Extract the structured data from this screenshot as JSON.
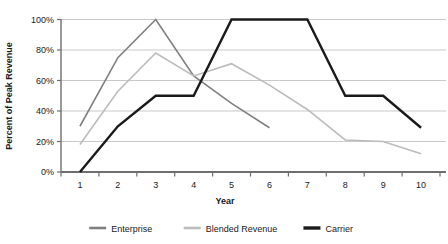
{
  "chart_data": {
    "type": "line",
    "title": "",
    "xlabel": "Year",
    "ylabel": "Percent of Peak Revenue",
    "categories": [
      "1",
      "2",
      "3",
      "4",
      "5",
      "6",
      "7",
      "8",
      "9",
      "10"
    ],
    "x": [
      1,
      2,
      3,
      4,
      5,
      6,
      7,
      8,
      9,
      10
    ],
    "ylim": [
      0,
      100
    ],
    "ytick_labels": [
      "0%",
      "20%",
      "40%",
      "60%",
      "80%",
      "100%"
    ],
    "ytick_values": [
      0,
      20,
      40,
      60,
      80,
      100
    ],
    "grid": true,
    "legend_position": "bottom",
    "series": [
      {
        "name": "Enterprise",
        "color": "#808080",
        "width": 1.6,
        "values": [
          30,
          75,
          100,
          63,
          45,
          29,
          null,
          null,
          null,
          null
        ]
      },
      {
        "name": "Blended Revenue",
        "color": "#bcbcbc",
        "width": 1.6,
        "values": [
          18,
          53,
          78,
          63,
          71,
          57,
          41,
          21,
          20,
          12
        ]
      },
      {
        "name": "Carrier",
        "color": "#1a1a1a",
        "width": 2.4,
        "values": [
          0,
          30,
          50,
          50,
          100,
          100,
          100,
          50,
          50,
          29
        ]
      }
    ]
  },
  "axes": {
    "x_label": "Year",
    "y_label": "Percent of Peak Revenue"
  },
  "legend": {
    "items": [
      {
        "label": "Enterprise",
        "color": "#808080",
        "width": 2.6
      },
      {
        "label": "Blended Revenue",
        "color": "#bcbcbc",
        "width": 2.6
      },
      {
        "label": "Carrier",
        "color": "#1a1a1a",
        "width": 3.4
      }
    ]
  },
  "colors": {
    "enterprise": "#808080",
    "blended_revenue": "#bcbcbc",
    "carrier": "#1a1a1a",
    "grid": "#c9c9c9",
    "axis": "#6e6e6e",
    "text": "#1a1a1a",
    "background": "#ffffff"
  }
}
